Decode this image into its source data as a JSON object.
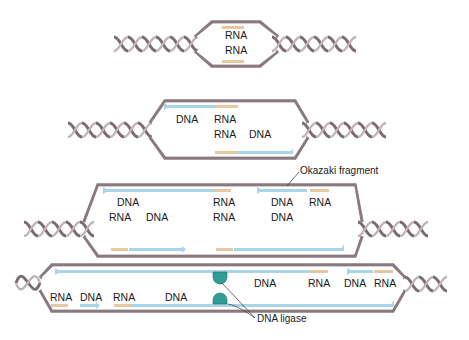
{
  "colors": {
    "strand": "#8a7a80",
    "strand_dark": "#7d6b72",
    "dna": "#a8d4ec",
    "rna": "#e6c9a0",
    "ligase": "#2f9c96"
  },
  "stages": [
    {
      "id": 1,
      "labels": [
        "RNA",
        "RNA"
      ]
    },
    {
      "id": 2,
      "labels": [
        "DNA",
        "RNA",
        "RNA",
        "DNA"
      ]
    },
    {
      "id": 3,
      "labels": [
        "DNA",
        "RNA",
        "DNA",
        "RNA",
        "RNA",
        "DNA",
        "RNA",
        "DNA"
      ],
      "annotation": "Okazaki fragment"
    },
    {
      "id": 4,
      "labels": [
        "DNA",
        "RNA",
        "DNA",
        "RNA",
        "RNA",
        "DNA",
        "RNA",
        "DNA"
      ],
      "annotation": "DNA ligase"
    }
  ]
}
